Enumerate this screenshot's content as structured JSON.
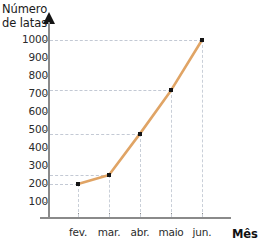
{
  "chart_data": {
    "type": "line",
    "title": "",
    "categories": [
      "fev.",
      "mar.",
      "abr.",
      "maio",
      "jun."
    ],
    "values": [
      200,
      250,
      480,
      720,
      1000
    ],
    "xlabel": "Mês",
    "ylabel": "Número\nde latas",
    "ylabel_line1": "Número",
    "ylabel_line2": "de latas",
    "ytick_labels": [
      "100",
      "200",
      "300",
      "400",
      "500",
      "600",
      "700",
      "800",
      "900",
      "1000"
    ],
    "ytick_values": [
      100,
      200,
      300,
      400,
      500,
      600,
      700,
      800,
      900,
      1000
    ],
    "ylim": [
      0,
      1060
    ],
    "grid": "dashed-guides-to-points",
    "legend": "none",
    "series_color": "#E0A465",
    "marker_color": "#141414",
    "axis_color": "#8A8A8A",
    "grid_color": "#C5CBD5",
    "background": "#FFFFFF"
  }
}
